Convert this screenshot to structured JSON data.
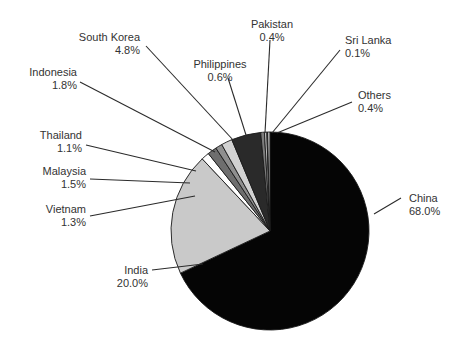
{
  "chart_data": {
    "type": "pie",
    "title": "",
    "subtitle": "",
    "xlabel": "",
    "ylabel": "",
    "grid": false,
    "legend_position": "outside-callouts",
    "start_angle_deg": 0,
    "direction": "clockwise",
    "center": {
      "x": 270,
      "y": 231
    },
    "radius": 99,
    "labels": [
      "China",
      "India",
      "Vietnam",
      "Malaysia",
      "Thailand",
      "Indonesia",
      "South Korea",
      "Philippines",
      "Pakistan",
      "Sri Lanka",
      "Others"
    ],
    "values": [
      68.0,
      20.0,
      1.3,
      1.5,
      1.1,
      1.8,
      4.8,
      0.6,
      0.4,
      0.1,
      0.4
    ],
    "value_labels": [
      "68.0%",
      "20.0%",
      "1.3%",
      "1.5%",
      "1.1%",
      "1.8%",
      "4.8%",
      "0.6%",
      "0.4%",
      "0.1%",
      "0.4%"
    ],
    "unit": "%",
    "colors": [
      "#050505",
      "#c9c9c9",
      "#ffffff",
      "#6e6e6e",
      "#8f8f8f",
      "#d2d2d2",
      "#2a2a2a",
      "#7c7c7c",
      "#c0c0c0",
      "#ededed",
      "#b5b5b5"
    ],
    "slices": [
      {
        "name": "China",
        "value": 68.0,
        "value_label": "68.0%",
        "color": "#050505"
      },
      {
        "name": "India",
        "value": 20.0,
        "value_label": "20.0%",
        "color": "#c9c9c9"
      },
      {
        "name": "Vietnam",
        "value": 1.3,
        "value_label": "1.3%",
        "color": "#ffffff"
      },
      {
        "name": "Malaysia",
        "value": 1.5,
        "value_label": "1.5%",
        "color": "#6e6e6e"
      },
      {
        "name": "Thailand",
        "value": 1.1,
        "value_label": "1.1%",
        "color": "#8f8f8f"
      },
      {
        "name": "Indonesia",
        "value": 1.8,
        "value_label": "1.8%",
        "color": "#d2d2d2"
      },
      {
        "name": "South Korea",
        "value": 4.8,
        "value_label": "4.8%",
        "color": "#2a2a2a"
      },
      {
        "name": "Philippines",
        "value": 0.6,
        "value_label": "0.6%",
        "color": "#7c7c7c"
      },
      {
        "name": "Pakistan",
        "value": 0.4,
        "value_label": "0.4%",
        "color": "#c0c0c0"
      },
      {
        "name": "Sri Lanka",
        "value": 0.1,
        "value_label": "0.1%",
        "color": "#ededed"
      },
      {
        "name": "Others",
        "value": 0.4,
        "value_label": "0.4%",
        "color": "#b5b5b5"
      }
    ]
  },
  "callouts": [
    {
      "name": "China",
      "value_label": "68.0%",
      "text_x": 409,
      "text_y": 202,
      "anchor": "start",
      "line": [
        [
          374,
          214
        ],
        [
          401,
          198
        ]
      ]
    },
    {
      "name": "India",
      "value_label": "20.0%",
      "text_x": 148,
      "text_y": 274,
      "anchor": "end",
      "line": [
        [
          203,
          264
        ],
        [
          152,
          270
        ]
      ]
    },
    {
      "name": "Vietnam",
      "value_label": "1.3%",
      "text_x": 86,
      "text_y": 213,
      "anchor": "end",
      "line": [
        [
          195,
          196
        ],
        [
          90,
          216
        ]
      ]
    },
    {
      "name": "Malaysia",
      "value_label": "1.5%",
      "text_x": 86,
      "text_y": 175,
      "anchor": "end",
      "line": [
        [
          190,
          183
        ],
        [
          90,
          179
        ]
      ]
    },
    {
      "name": "Thailand",
      "value_label": "1.1%",
      "text_x": 82,
      "text_y": 139,
      "anchor": "end",
      "line": [
        [
          196,
          171
        ],
        [
          86,
          145
        ]
      ]
    },
    {
      "name": "Indonesia",
      "value_label": "1.8%",
      "text_x": 77,
      "text_y": 76,
      "anchor": "end",
      "line": [
        [
          215,
          152
        ],
        [
          80,
          82
        ]
      ]
    },
    {
      "name": "South Korea",
      "value_label": "4.8%",
      "text_x": 140,
      "text_y": 41,
      "anchor": "end",
      "line": [
        [
          234,
          141
        ],
        [
          146,
          46
        ]
      ]
    },
    {
      "name": "Philippines",
      "value_label": "0.6%",
      "text_x": 220,
      "text_y": 68,
      "anchor": "middle",
      "line": [
        [
          246,
          135
        ],
        [
          228,
          78
        ]
      ]
    },
    {
      "name": "Pakistan",
      "value_label": "0.4%",
      "text_x": 272,
      "text_y": 28,
      "anchor": "middle",
      "line": [
        [
          265,
          133
        ],
        [
          270,
          40
        ]
      ]
    },
    {
      "name": "Sri Lanka",
      "value_label": "0.1%",
      "text_x": 345,
      "text_y": 44,
      "anchor": "start",
      "line": [
        [
          272,
          133
        ],
        [
          340,
          50
        ]
      ]
    },
    {
      "name": "Others",
      "value_label": "0.4%",
      "text_x": 358,
      "text_y": 99,
      "anchor": "start",
      "line": [
        [
          277,
          133
        ],
        [
          352,
          102
        ]
      ]
    }
  ]
}
